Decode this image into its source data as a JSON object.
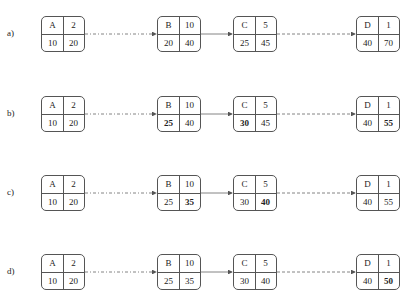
{
  "rows": [
    {
      "label": "a)",
      "nodes": [
        {
          "name": "A",
          "duration": "2",
          "es": "10",
          "ef": "20",
          "bold": []
        },
        {
          "name": "B",
          "duration": "10",
          "es": "20",
          "ef": "40",
          "bold": []
        },
        {
          "name": "C",
          "duration": "5",
          "es": "25",
          "ef": "45",
          "bold": []
        },
        {
          "name": "D",
          "duration": "1",
          "es": "40",
          "ef": "70",
          "bold": []
        }
      ]
    },
    {
      "label": "b)",
      "nodes": [
        {
          "name": "A",
          "duration": "2",
          "es": "10",
          "ef": "20",
          "bold": []
        },
        {
          "name": "B",
          "duration": "10",
          "es": "25",
          "ef": "40",
          "bold": [
            "es"
          ]
        },
        {
          "name": "C",
          "duration": "5",
          "es": "30",
          "ef": "45",
          "bold": [
            "es"
          ]
        },
        {
          "name": "D",
          "duration": "1",
          "es": "40",
          "ef": "55",
          "bold": [
            "ef"
          ]
        }
      ]
    },
    {
      "label": "c)",
      "nodes": [
        {
          "name": "A",
          "duration": "2",
          "es": "10",
          "ef": "20",
          "bold": []
        },
        {
          "name": "B",
          "duration": "10",
          "es": "25",
          "ef": "35",
          "bold": [
            "ef"
          ]
        },
        {
          "name": "C",
          "duration": "5",
          "es": "30",
          "ef": "40",
          "bold": [
            "ef"
          ]
        },
        {
          "name": "D",
          "duration": "1",
          "es": "40",
          "ef": "55",
          "bold": []
        }
      ]
    },
    {
      "label": "d)",
      "nodes": [
        {
          "name": "A",
          "duration": "2",
          "es": "10",
          "ef": "20",
          "bold": []
        },
        {
          "name": "B",
          "duration": "10",
          "es": "25",
          "ef": "35",
          "bold": []
        },
        {
          "name": "C",
          "duration": "5",
          "es": "30",
          "ef": "40",
          "bold": []
        },
        {
          "name": "D",
          "duration": "1",
          "es": "40",
          "ef": "50",
          "bold": [
            "ef"
          ]
        }
      ]
    }
  ],
  "edges": [
    {
      "from": "A",
      "to": "B",
      "style": "dashdot"
    },
    {
      "from": "B",
      "to": "C",
      "style": "solid"
    },
    {
      "from": "C",
      "to": "D",
      "style": "dashed"
    }
  ],
  "colors": {
    "stroke": "#555555",
    "text": "#222222"
  }
}
